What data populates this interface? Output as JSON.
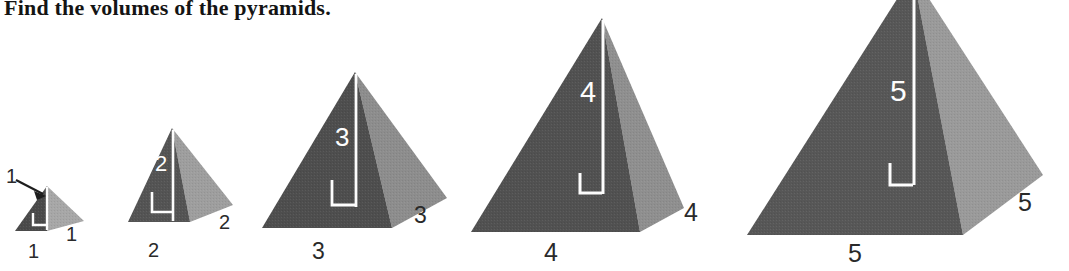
{
  "title": "Find the volumes of the pyramids.",
  "figure": {
    "name": "five-pyramids-series",
    "background_color": "#ffffff",
    "face_colors": {
      "front_dark": "#565656",
      "side_light": "#9a9a9a",
      "front_dark_small": "#4a4a4a",
      "side_light_small": "#a7a7a7",
      "height_line": "#fdfdfd",
      "label_text": "#2a2a2a",
      "height_label_text": "#fdfdfd"
    }
  },
  "pyramids": [
    {
      "index": 1,
      "name": "pyramid-1",
      "height": "1",
      "base_front": "1",
      "base_side": "1",
      "callout": "1",
      "has_callout_arrow": true
    },
    {
      "index": 2,
      "name": "pyramid-2",
      "height": "2",
      "base_front": "2",
      "base_side": "2",
      "callout": null,
      "has_callout_arrow": false
    },
    {
      "index": 3,
      "name": "pyramid-3",
      "height": "3",
      "base_front": "3",
      "base_side": "3",
      "callout": null,
      "has_callout_arrow": false
    },
    {
      "index": 4,
      "name": "pyramid-4",
      "height": "4",
      "base_front": "4",
      "base_side": "4",
      "callout": null,
      "has_callout_arrow": false
    },
    {
      "index": 5,
      "name": "pyramid-5",
      "height": "5",
      "base_front": "5",
      "base_side": "5",
      "callout": null,
      "has_callout_arrow": false
    }
  ]
}
